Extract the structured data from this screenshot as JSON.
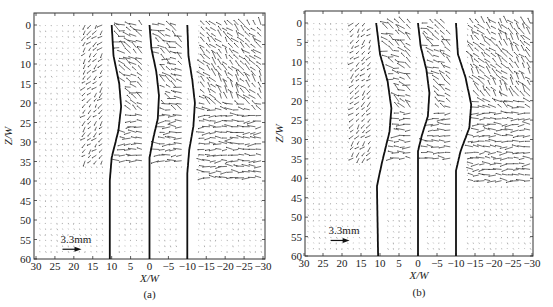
{
  "figure": {
    "panels": [
      {
        "id": "a",
        "caption": "(a)",
        "scale_label": "3.3mm"
      },
      {
        "id": "b",
        "caption": "(b)",
        "scale_label": "3.3mm"
      }
    ]
  },
  "chart_data": [
    {
      "type": "quiver",
      "panel": "a",
      "title": "",
      "caption": "(a)",
      "xlabel": "X/W",
      "ylabel": "Z/W",
      "xlim": [
        30,
        -30
      ],
      "ylim": [
        60,
        0
      ],
      "x_ticks": [
        30,
        25,
        20,
        15,
        10,
        5,
        0,
        -5,
        -10,
        -15,
        -20,
        -25,
        -30
      ],
      "y_ticks": [
        0,
        5,
        10,
        15,
        20,
        25,
        30,
        35,
        40,
        45,
        50,
        55,
        60
      ],
      "grid": false,
      "scale_arrow": {
        "label": "3.3mm",
        "x": 23,
        "z": 57.5
      },
      "boundary_curves": [
        {
          "name": "left",
          "points": [
            [
              10,
              0
            ],
            [
              9.5,
              8
            ],
            [
              8,
              15
            ],
            [
              7.5,
              21
            ],
            [
              8.2,
              27
            ],
            [
              10,
              34
            ],
            [
              10.5,
              40
            ],
            [
              10.5,
              60
            ]
          ]
        },
        {
          "name": "center",
          "points": [
            [
              0,
              0
            ],
            [
              -0.5,
              6
            ],
            [
              -1.8,
              12
            ],
            [
              -2.5,
              18
            ],
            [
              -2.2,
              24
            ],
            [
              -1,
              29
            ],
            [
              0,
              34
            ],
            [
              0,
              60
            ]
          ]
        },
        {
          "name": "right",
          "points": [
            [
              -10,
              0
            ],
            [
              -10.3,
              8
            ],
            [
              -11.3,
              14
            ],
            [
              -12,
              20
            ],
            [
              -11.6,
              26
            ],
            [
              -10.5,
              32
            ],
            [
              -10,
              38
            ],
            [
              -10,
              60
            ]
          ]
        }
      ],
      "vector_regions": [
        {
          "x_range": [
            18,
            12
          ],
          "z_range": [
            0,
            35
          ],
          "intensity": "moderate"
        },
        {
          "x_range": [
            8,
            2
          ],
          "z_range": [
            0,
            35
          ],
          "intensity": "strong"
        },
        {
          "x_range": [
            -2,
            -9
          ],
          "z_range": [
            0,
            35
          ],
          "intensity": "strong"
        },
        {
          "x_range": [
            -14,
            -30
          ],
          "z_range": [
            0,
            40
          ],
          "intensity": "strong"
        }
      ]
    },
    {
      "type": "quiver",
      "panel": "b",
      "title": "",
      "caption": "(b)",
      "xlabel": "X/W",
      "ylabel": "Z/W",
      "xlim": [
        30,
        -30
      ],
      "ylim": [
        60,
        0
      ],
      "x_ticks": [
        30,
        25,
        20,
        15,
        10,
        5,
        0,
        -5,
        -10,
        -15,
        -20,
        -25,
        -30
      ],
      "y_ticks": [
        0,
        5,
        10,
        15,
        20,
        25,
        30,
        35,
        40,
        45,
        50,
        55,
        60
      ],
      "grid": false,
      "scale_arrow": {
        "label": "3.3mm",
        "x": 23,
        "z": 56
      },
      "boundary_curves": [
        {
          "name": "left",
          "points": [
            [
              11,
              0
            ],
            [
              10,
              8
            ],
            [
              8,
              15
            ],
            [
              7,
              22
            ],
            [
              7.5,
              28
            ],
            [
              9.5,
              36
            ],
            [
              10.8,
              42
            ],
            [
              10.5,
              60
            ]
          ]
        },
        {
          "name": "center",
          "points": [
            [
              0,
              0
            ],
            [
              -0.7,
              6
            ],
            [
              -2.2,
              12
            ],
            [
              -3,
              18
            ],
            [
              -2.6,
              24
            ],
            [
              -1,
              29
            ],
            [
              0,
              33
            ],
            [
              0,
              60
            ]
          ]
        },
        {
          "name": "right",
          "points": [
            [
              -10,
              0
            ],
            [
              -10.5,
              8
            ],
            [
              -12.5,
              14
            ],
            [
              -14,
              21
            ],
            [
              -13.5,
              27
            ],
            [
              -11.2,
              33
            ],
            [
              -10,
              38
            ],
            [
              -10,
              60
            ]
          ]
        }
      ],
      "vector_regions": [
        {
          "x_range": [
            18,
            12
          ],
          "z_range": [
            0,
            35
          ],
          "intensity": "moderate"
        },
        {
          "x_range": [
            8,
            2
          ],
          "z_range": [
            0,
            35
          ],
          "intensity": "strong"
        },
        {
          "x_range": [
            -2,
            -9
          ],
          "z_range": [
            0,
            35
          ],
          "intensity": "strong"
        },
        {
          "x_range": [
            -14,
            -30
          ],
          "z_range": [
            0,
            42
          ],
          "intensity": "strong"
        }
      ]
    }
  ]
}
